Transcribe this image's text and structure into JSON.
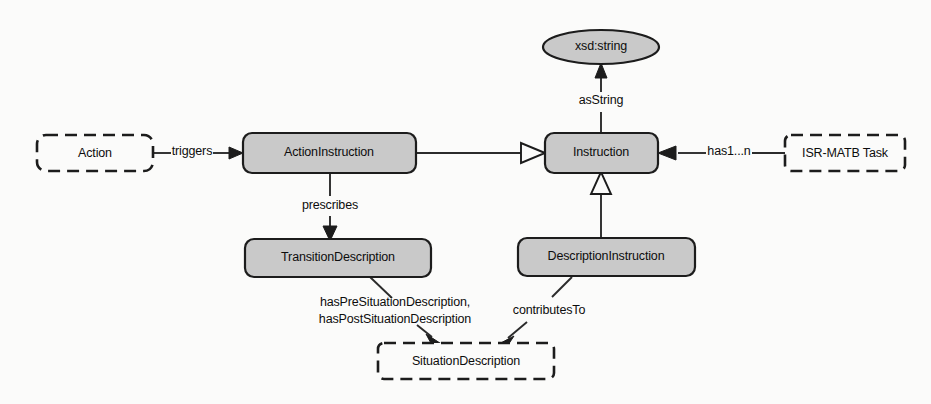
{
  "diagram": {
    "background_color": "#fbfbfa",
    "node_fill_color": "#c9c9c9",
    "stroke_color": "#1c1c1c",
    "nodes": [
      {
        "id": "action",
        "label": "Action",
        "shape": "rounded-rect",
        "style": "dashed",
        "x": 37,
        "y": 135,
        "w": 116,
        "h": 36
      },
      {
        "id": "action_instruction",
        "label": "ActionInstruction",
        "shape": "rounded-rect",
        "style": "solid",
        "x": 243,
        "y": 133,
        "w": 173,
        "h": 40
      },
      {
        "id": "instruction",
        "label": "Instruction",
        "shape": "rounded-rect",
        "style": "solid",
        "x": 545,
        "y": 133,
        "w": 113,
        "h": 40
      },
      {
        "id": "isr_matb_task",
        "label": "ISR-MATB Task",
        "shape": "rounded-rect",
        "style": "dashed",
        "x": 785,
        "y": 135,
        "w": 120,
        "h": 36
      },
      {
        "id": "xsd_string",
        "label": "xsd:string",
        "shape": "ellipse",
        "style": "solid",
        "x": 543,
        "y": 30,
        "w": 116,
        "h": 34
      },
      {
        "id": "transition_description",
        "label": "TransitionDescription",
        "shape": "rounded-rect",
        "style": "solid",
        "x": 245,
        "y": 239,
        "w": 186,
        "h": 38
      },
      {
        "id": "description_instruction",
        "label": "DescriptionInstruction",
        "shape": "rounded-rect",
        "style": "solid",
        "x": 518,
        "y": 238,
        "w": 177,
        "h": 38
      },
      {
        "id": "situation_description",
        "label": "SituationDescription",
        "shape": "rounded-rect",
        "style": "dashed",
        "x": 378,
        "y": 343,
        "w": 176,
        "h": 36
      }
    ],
    "edges": [
      {
        "id": "triggers",
        "label": "triggers",
        "from": "action",
        "to": "action_instruction",
        "arrow": "solid-arrow"
      },
      {
        "id": "as_string",
        "label": "asString",
        "from": "instruction",
        "to": "xsd_string",
        "arrow": "solid-arrow"
      },
      {
        "id": "has_1_n",
        "label": "has1...n",
        "from": "isr_matb_task",
        "to": "instruction",
        "arrow": "solid-arrow"
      },
      {
        "id": "is_a_action",
        "label": "",
        "from": "action_instruction",
        "to": "instruction",
        "arrow": "hollow-triangle"
      },
      {
        "id": "is_a_description",
        "label": "",
        "from": "description_instruction",
        "to": "instruction",
        "arrow": "hollow-triangle"
      },
      {
        "id": "prescribes",
        "label": "prescribes",
        "from": "action_instruction",
        "to": "transition_description",
        "arrow": "solid-arrow"
      },
      {
        "id": "has_situation_descs",
        "label_line1": "hasPreSituationDescription,",
        "label_line2": "hasPostSituationDescription",
        "from": "transition_description",
        "to": "situation_description",
        "arrow": "solid-arrow"
      },
      {
        "id": "contributes_to",
        "label": "contributesTo",
        "from": "description_instruction",
        "to": "situation_description",
        "arrow": "solid-arrow"
      }
    ]
  }
}
